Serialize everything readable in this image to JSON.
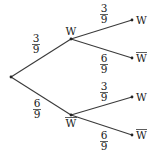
{
  "diagram": {
    "type": "probability-tree",
    "colors": {
      "line": "#3a3a3a",
      "text": "#222222",
      "background": "#ffffff"
    },
    "root": {
      "x": 11,
      "y": 77
    },
    "level1": [
      {
        "id": "W",
        "label": "W",
        "complement": false,
        "x": 71,
        "y": 39,
        "prob_num": "3",
        "prob_den": "9",
        "prob_x": 36,
        "prob_y": 34,
        "label_pos": "above"
      },
      {
        "id": "Wbar",
        "label": "W",
        "complement": true,
        "x": 71,
        "y": 115,
        "prob_num": "6",
        "prob_den": "9",
        "prob_x": 37,
        "prob_y": 100,
        "label_pos": "below"
      }
    ],
    "level2": [
      {
        "parent": "W",
        "label": "W",
        "complement": false,
        "x": 132,
        "y": 20,
        "prob_num": "3",
        "prob_den": "9",
        "prob_x": 104,
        "prob_y": 5
      },
      {
        "parent": "W",
        "label": "W",
        "complement": true,
        "x": 132,
        "y": 58,
        "prob_num": "6",
        "prob_den": "9",
        "prob_x": 104,
        "prob_y": 55
      },
      {
        "parent": "Wbar",
        "label": "W",
        "complement": false,
        "x": 132,
        "y": 97,
        "prob_num": "3",
        "prob_den": "9",
        "prob_x": 104,
        "prob_y": 83
      },
      {
        "parent": "Wbar",
        "label": "W",
        "complement": true,
        "x": 132,
        "y": 135,
        "prob_num": "6",
        "prob_den": "9",
        "prob_x": 104,
        "prob_y": 131
      }
    ]
  }
}
